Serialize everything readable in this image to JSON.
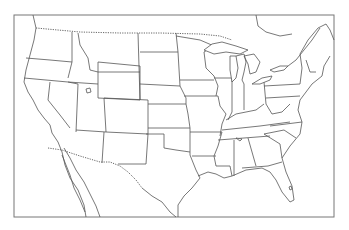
{
  "map": {
    "title": "",
    "type": "blank outline map",
    "region": "Contiguous United States with parts of Canada and Mexico",
    "colors": {
      "background": "#ffffff",
      "lines": "#555555",
      "frame": "#777777"
    }
  }
}
